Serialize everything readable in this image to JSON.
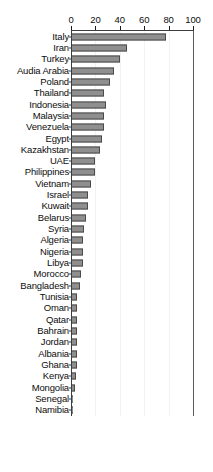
{
  "chart_data": {
    "type": "bar",
    "orientation": "horizontal",
    "title": "",
    "subtitle": "",
    "xlabel": "",
    "ylabel": "",
    "xlim": [
      0,
      100
    ],
    "ylim": null,
    "grid": true,
    "legend": null,
    "legend_position": "none",
    "xticks": [
      0,
      20,
      40,
      60,
      80,
      100
    ],
    "xtick_labels": [
      "0",
      "20",
      "40",
      "60",
      "80",
      "100"
    ],
    "categories": [
      "Italy",
      "Iran",
      "Turkey",
      "Audia Arabia",
      "Poland",
      "Thailand",
      "Indonesia",
      "Malaysia",
      "Venezuela",
      "Egypt",
      "Kazakhstan",
      "UAE",
      "Philippines",
      "Vietnam",
      "Israel",
      "Kuwait",
      "Belarus",
      "Syria",
      "Algeria",
      "Nigeria",
      "Libya",
      "Morocco",
      "Bangladesh",
      "Tunisia",
      "Oman",
      "Qatar",
      "Bahrain",
      "Jordan",
      "Albania",
      "Ghana",
      "Kenya",
      "Mongolia",
      "Senegal",
      "Namibia"
    ],
    "values": [
      78,
      46,
      40,
      35,
      32,
      27,
      29,
      27,
      27,
      25,
      24,
      20,
      20,
      16,
      14,
      14,
      12,
      11,
      10,
      10,
      9.5,
      8,
      7.5,
      5,
      5,
      5,
      5,
      5,
      5,
      5,
      4,
      3,
      1,
      0.5
    ],
    "colors": {
      "bar_fill": "#8f8f8f",
      "bar_border": "#4a4a4a",
      "axis": "#3c3c3c",
      "gridline": "#f2f2f2",
      "text": "#0d0d0d",
      "background": "#ffffff"
    }
  }
}
